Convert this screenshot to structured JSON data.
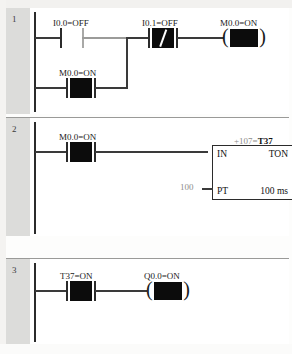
{
  "document": {
    "kind": "ladder-logic-diagram",
    "program": "PLC ladder program status view",
    "background_color": "#ffffff",
    "gutter_color": "#dcdcda",
    "wire_color": "#3a3a3a",
    "energized_fill_color": "#0c0c0c"
  },
  "rungs": [
    {
      "number": "1",
      "elements": {
        "contact_a": {
          "label": "I0.0=OFF",
          "type": "normally-open",
          "state": "OFF",
          "energized": false
        },
        "contact_b": {
          "label": "I0.1=OFF",
          "type": "normally-closed",
          "state": "OFF",
          "energized": true,
          "slash": "/"
        },
        "coil": {
          "label": "M0.0=ON",
          "type": "output-coil",
          "state": "ON",
          "energized": true
        },
        "branch_contact": {
          "label": "M0.0=ON",
          "type": "normally-open",
          "state": "ON",
          "energized": true
        }
      }
    },
    {
      "number": "2",
      "elements": {
        "contact_a": {
          "label": "M0.0=ON",
          "type": "normally-open",
          "state": "ON",
          "energized": true
        },
        "timer": {
          "top_label_prefix": "+107",
          "top_label_separator": "=",
          "top_label_name": "T37",
          "input_label": "IN",
          "instruction": "TON",
          "preset_label": "PT",
          "preset_value": "100",
          "time_base": "100 ms"
        }
      }
    },
    {
      "number": "3",
      "elements": {
        "contact_a": {
          "label": "T37=ON",
          "type": "normally-open",
          "state": "ON",
          "energized": true
        },
        "coil": {
          "label": "Q0.0=ON",
          "type": "output-coil",
          "state": "ON",
          "energized": true
        }
      }
    }
  ]
}
